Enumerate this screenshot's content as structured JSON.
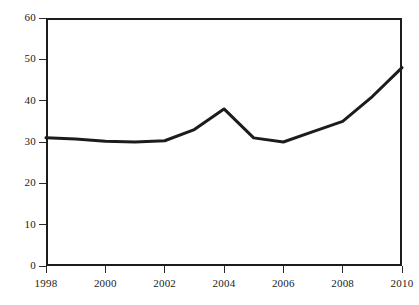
{
  "chart_data": {
    "type": "line",
    "title": "",
    "subtitle": "",
    "xlabel": "",
    "ylabel": "",
    "xlim": [
      1998,
      2010
    ],
    "ylim": [
      0,
      60
    ],
    "grid": false,
    "legend": false,
    "legend_position": "none",
    "line_color": "#1c1c1c",
    "line_width_px": 3,
    "frame_color": "#1c1c1c",
    "background_color": "#ffffff",
    "x": [
      1998,
      1999,
      2000,
      2001,
      2002,
      2003,
      2004,
      2005,
      2006,
      2007,
      2008,
      2009,
      2010
    ],
    "values": [
      31,
      30.7,
      30.2,
      30,
      30.3,
      33,
      38,
      31,
      30,
      32.5,
      35,
      41,
      48
    ],
    "series": [
      {
        "name": "series-1",
        "values": [
          31,
          30.7,
          30.2,
          30,
          30.3,
          33,
          38,
          31,
          30,
          32.5,
          35,
          41,
          48
        ]
      }
    ],
    "yticks": [
      0,
      10,
      20,
      30,
      40,
      50,
      60
    ],
    "ytick_labels": [
      "0",
      "10",
      "20",
      "30",
      "40",
      "50",
      "60"
    ],
    "xticks": [
      1998,
      2000,
      2002,
      2004,
      2006,
      2008,
      2010
    ],
    "xtick_labels": [
      "1998",
      "2000",
      "2002",
      "2004",
      "2006",
      "2008",
      "2010"
    ]
  }
}
